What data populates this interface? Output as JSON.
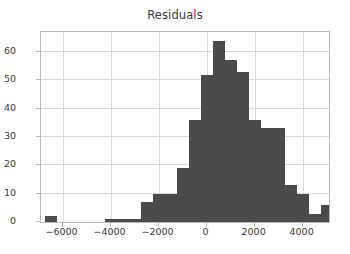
{
  "chart_data": {
    "type": "bar",
    "title": "Residuals",
    "xlabel": "",
    "ylabel": "",
    "xlim": [
      -6900,
      5100
    ],
    "ylim": [
      0,
      67
    ],
    "grid": true,
    "legend": null,
    "bin_width": 500,
    "bar_color": "#4a4a4a",
    "xticks": [
      -6000,
      -4000,
      -2000,
      0,
      2000,
      4000
    ],
    "xtick_labels": [
      "−6000",
      "−4000",
      "−2000",
      "0",
      "2000",
      "4000"
    ],
    "yticks": [
      0,
      10,
      20,
      30,
      40,
      50,
      60
    ],
    "ytick_labels": [
      "0",
      "10",
      "20",
      "30",
      "40",
      "50",
      "60"
    ],
    "bins": [
      {
        "left": -6750,
        "right": -6250,
        "center": -6500,
        "value": 2
      },
      {
        "left": -4250,
        "right": -3750,
        "center": -4000,
        "value": 1
      },
      {
        "left": -3750,
        "right": -3250,
        "center": -3500,
        "value": 1
      },
      {
        "left": -3250,
        "right": -2750,
        "center": -3000,
        "value": 1
      },
      {
        "left": -2750,
        "right": -2250,
        "center": -2500,
        "value": 7
      },
      {
        "left": -2250,
        "right": -1750,
        "center": -2000,
        "value": 10
      },
      {
        "left": -1750,
        "right": -1250,
        "center": -1500,
        "value": 10
      },
      {
        "left": -1250,
        "right": -750,
        "center": -1000,
        "value": 19
      },
      {
        "left": -750,
        "right": -250,
        "center": -500,
        "value": 36
      },
      {
        "left": -250,
        "right": 250,
        "center": 0,
        "value": 52
      },
      {
        "left": 250,
        "right": 750,
        "center": 500,
        "value": 64
      },
      {
        "left": 750,
        "right": 1250,
        "center": 1000,
        "value": 57
      },
      {
        "left": 1250,
        "right": 1750,
        "center": 1500,
        "value": 53
      },
      {
        "left": 1750,
        "right": 2250,
        "center": 2000,
        "value": 36
      },
      {
        "left": 2250,
        "right": 2750,
        "center": 2500,
        "value": 33
      },
      {
        "left": 2750,
        "right": 3250,
        "center": 3000,
        "value": 33
      },
      {
        "left": 3250,
        "right": 3750,
        "center": 3500,
        "value": 13
      },
      {
        "left": 3750,
        "right": 4250,
        "center": 4000,
        "value": 10
      },
      {
        "left": 4250,
        "right": 4750,
        "center": 4500,
        "value": 3
      },
      {
        "left": 4750,
        "right": 5250,
        "center": 5000,
        "value": 6
      },
      {
        "left": 6250,
        "right": 6750,
        "center": 6500,
        "value": 1
      }
    ]
  }
}
